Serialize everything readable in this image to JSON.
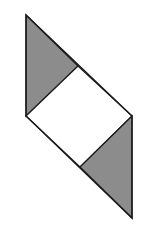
{
  "diagram": {
    "type": "geometric-figure",
    "colors": {
      "background": "#ffffff",
      "stroke": "#1a1a1a",
      "shaded_fill": "#8c8c8c",
      "square_fill": "#ffffff"
    },
    "shapes": {
      "upper_triangle": {
        "points": "26,15 78,66 26,116",
        "shaded": true
      },
      "center_square": {
        "points": "78,66 132,116 80,167 26,116",
        "shaded": false
      },
      "lower_triangle": {
        "points": "132,116 132,218 80,167",
        "shaded": true
      },
      "outline": {
        "points": "26,15 132,116 132,218 26,116"
      }
    }
  }
}
